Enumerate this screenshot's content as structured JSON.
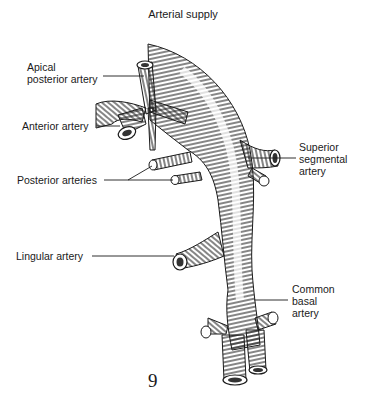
{
  "title": "Arterial supply",
  "labels": {
    "apical_posterior": [
      "Apical",
      "posterior artery"
    ],
    "anterior": "Anterior artery",
    "posterior": "Posterior arteries",
    "lingular": "Lingular artery",
    "superior_segmental": [
      "Superior",
      "segmental",
      "artery"
    ],
    "common_basal": [
      "Common",
      "basal",
      "artery"
    ]
  },
  "page_number": "9",
  "colors": {
    "ink": "#1a1a1a",
    "background": "#ffffff"
  }
}
